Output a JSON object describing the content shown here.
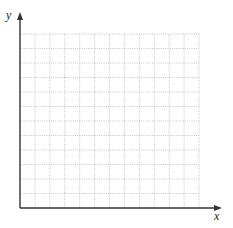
{
  "diagram": {
    "type": "blank coordinate grid",
    "x_axis_label": "x",
    "y_axis_label": "y",
    "grid": {
      "columns": 12,
      "rows": 12,
      "line_style": "dotted",
      "line_color": "#bbbbbb"
    },
    "axis_color": "#333333"
  }
}
